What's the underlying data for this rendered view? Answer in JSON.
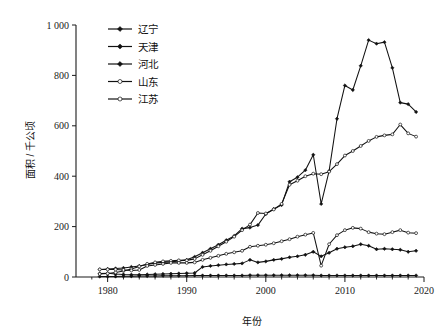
{
  "chart_data": {
    "type": "line",
    "title": "",
    "xlabel": "年份",
    "ylabel": "面积 / 千公顷",
    "xlim": [
      1976,
      2020
    ],
    "ylim": [
      0,
      1000
    ],
    "xticks": [
      "1980",
      "1990",
      "2000",
      "2010",
      "2020"
    ],
    "xtick_values": [
      1980,
      1990,
      2000,
      2010,
      2020
    ],
    "yticks": [
      "0",
      "200",
      "400",
      "600",
      "800",
      "1 000"
    ],
    "ytick_values": [
      0,
      200,
      400,
      600,
      800,
      1000
    ],
    "grid": false,
    "legend_position": "top-left",
    "x": [
      1979,
      1980,
      1981,
      1982,
      1983,
      1984,
      1985,
      1986,
      1987,
      1988,
      1989,
      1990,
      1991,
      1992,
      1993,
      1994,
      1995,
      1996,
      1997,
      1998,
      1999,
      2000,
      2001,
      2002,
      2003,
      2004,
      2005,
      2006,
      2007,
      2008,
      2009,
      2010,
      2011,
      2012,
      2013,
      2014,
      2015,
      2016,
      2017,
      2018,
      2019
    ],
    "series": [
      {
        "name": "辽宁",
        "marker": "filled-diamond",
        "values": [
          30,
          32,
          34,
          36,
          40,
          44,
          50,
          55,
          58,
          60,
          64,
          68,
          80,
          96,
          112,
          128,
          146,
          163,
          192,
          196,
          206,
          250,
          270,
          286,
          378,
          396,
          424,
          485,
          290,
          420,
          628,
          760,
          742,
          838,
          940,
          926,
          932,
          830,
          692,
          686,
          655
        ]
      },
      {
        "name": "天津",
        "marker": "filled-diamond",
        "values": [
          2,
          2,
          2,
          3,
          3,
          4,
          4,
          4,
          5,
          5,
          5,
          5,
          6,
          6,
          6,
          6,
          6,
          6,
          6,
          7,
          7,
          7,
          7,
          7,
          7,
          7,
          7,
          7,
          6,
          6,
          6,
          6,
          6,
          6,
          6,
          6,
          6,
          6,
          6,
          6,
          6
        ]
      },
      {
        "name": "河北",
        "marker": "filled-diamond",
        "values": [
          14,
          15,
          12,
          10,
          9,
          9,
          10,
          11,
          12,
          13,
          14,
          15,
          16,
          40,
          44,
          47,
          50,
          52,
          54,
          68,
          58,
          62,
          68,
          72,
          78,
          82,
          88,
          100,
          82,
          96,
          112,
          118,
          122,
          130,
          124,
          110,
          112,
          110,
          108,
          100,
          104
        ]
      },
      {
        "name": "山东",
        "marker": "open-circle",
        "values": [
          12,
          14,
          18,
          24,
          32,
          42,
          52,
          58,
          62,
          64,
          66,
          66,
          72,
          88,
          104,
          122,
          140,
          160,
          186,
          208,
          254,
          252,
          268,
          290,
          366,
          382,
          400,
          410,
          408,
          418,
          448,
          482,
          500,
          520,
          540,
          556,
          562,
          566,
          605,
          570,
          557
        ]
      },
      {
        "name": "江苏",
        "marker": "open-circle",
        "values": [
          30,
          30,
          30,
          28,
          26,
          28,
          44,
          48,
          52,
          56,
          56,
          56,
          58,
          68,
          76,
          84,
          92,
          98,
          104,
          120,
          124,
          128,
          134,
          142,
          150,
          160,
          168,
          175,
          45,
          130,
          166,
          186,
          195,
          192,
          178,
          172,
          170,
          178,
          186,
          176,
          174
        ]
      }
    ]
  },
  "axes": {
    "y_title": "面积 / 千公顷",
    "x_title": "年份"
  }
}
